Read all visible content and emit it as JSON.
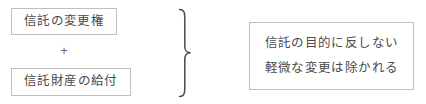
{
  "diagram": {
    "type": "grouping-brace-diagram",
    "background_color": "#ffffff",
    "border_color": "#bfbfbf",
    "text_color": "#4a4a4a",
    "left_group": {
      "items": [
        {
          "label": "信託の変更権"
        },
        {
          "label": "信託財産の給付"
        }
      ],
      "operator": "+"
    },
    "connector": {
      "glyph": "right-curly-brace",
      "orientation": "points-right"
    },
    "right_group": {
      "lines": [
        "信託の目的に反しない",
        "軽微な変更は除かれる"
      ]
    }
  }
}
